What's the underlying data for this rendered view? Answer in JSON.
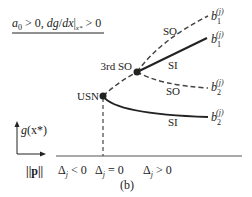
{
  "condition": {
    "a_sym": "a",
    "a_sub": "0",
    "part1": " > 0, ",
    "dg": "dg",
    "slash": "/",
    "dx": "dx",
    "bar": "|",
    "x_sub": "x*",
    "part2": " > 0"
  },
  "points": {
    "usn": "USN",
    "third_so": "3rd SO"
  },
  "branch_labels": {
    "so_upper": "SO",
    "si_upper": "SI",
    "so_lower": "SO",
    "si_lower": "SI"
  },
  "endpoints": [
    {
      "base": "b",
      "sub": "1",
      "sup": "(j)"
    },
    {
      "base": "b",
      "sub": "1",
      "sup": "(j)"
    },
    {
      "base": "b",
      "sub": "2",
      "sup": "(j)"
    },
    {
      "base": "b",
      "sub": "2",
      "sup": "(j)"
    }
  ],
  "axes": {
    "y_label_g": "g",
    "y_label_arg": "(x*)",
    "x_label": "||p||"
  },
  "regions": {
    "neg_delta": "Δ",
    "neg_sub": "j",
    "neg_rel": " < 0",
    "zero_delta": "Δ",
    "zero_sub": "j",
    "zero_rel": " = 0",
    "pos_delta": "Δ",
    "pos_sub": "j",
    "pos_rel": " > 0"
  },
  "caption": "(b)",
  "colors": {
    "line": "#222222",
    "dashed": "#444444"
  }
}
